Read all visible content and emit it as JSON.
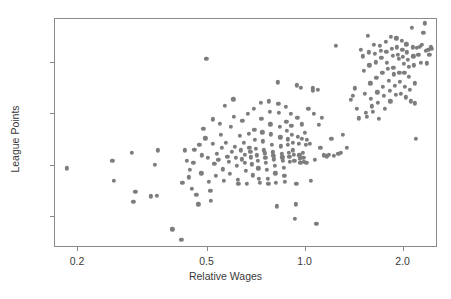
{
  "chart_data": {
    "type": "scatter",
    "title": "",
    "xlabel": "Relative Wages",
    "ylabel": "League Points",
    "xscale": "log",
    "yscale": "linear",
    "xlim": [
      0.17,
      2.55
    ],
    "ylim": [
      8,
      97
    ],
    "grid": false,
    "legend": null,
    "marker": {
      "shape": "circle",
      "color": "#7d7d7d",
      "size_px": 4.3
    },
    "xticks": [
      0.2,
      0.5,
      1.0,
      2.0
    ],
    "xtick_labels": [
      "0.2",
      "0.5",
      "1.0",
      "2.0"
    ],
    "yticks": [
      20,
      40,
      60,
      80
    ],
    "ytick_labels": [
      "20",
      "40",
      "60",
      "80"
    ],
    "n_points": 268,
    "points": [
      [
        0.185,
        39.0
      ],
      [
        0.255,
        41.9
      ],
      [
        0.258,
        34.2
      ],
      [
        0.292,
        45.0
      ],
      [
        0.3,
        29.7
      ],
      [
        0.296,
        26.0
      ],
      [
        0.335,
        28.1
      ],
      [
        0.35,
        28.2
      ],
      [
        0.345,
        40.2
      ],
      [
        0.352,
        46.0
      ],
      [
        0.39,
        15.3
      ],
      [
        0.415,
        11.2
      ],
      [
        0.425,
        45.9
      ],
      [
        0.418,
        33.3
      ],
      [
        0.432,
        42.0
      ],
      [
        0.44,
        38.3
      ],
      [
        0.438,
        35.5
      ],
      [
        0.455,
        46.2
      ],
      [
        0.452,
        41.0
      ],
      [
        0.448,
        30.9
      ],
      [
        0.462,
        28.6
      ],
      [
        0.468,
        25.0
      ],
      [
        0.472,
        48.0
      ],
      [
        0.48,
        44.0
      ],
      [
        0.478,
        37.0
      ],
      [
        0.485,
        54.2
      ],
      [
        0.492,
        50.6
      ],
      [
        0.496,
        81.4
      ],
      [
        0.5,
        43.0
      ],
      [
        0.505,
        33.7
      ],
      [
        0.51,
        30.3
      ],
      [
        0.512,
        26.4
      ],
      [
        0.518,
        58.0
      ],
      [
        0.52,
        48.5
      ],
      [
        0.525,
        40.8
      ],
      [
        0.53,
        36.0
      ],
      [
        0.535,
        44.5
      ],
      [
        0.54,
        42.2
      ],
      [
        0.545,
        56.3
      ],
      [
        0.55,
        52.0
      ],
      [
        0.552,
        46.8
      ],
      [
        0.558,
        38.6
      ],
      [
        0.562,
        34.0
      ],
      [
        0.566,
        63.2
      ],
      [
        0.57,
        49.0
      ],
      [
        0.575,
        43.5
      ],
      [
        0.58,
        41.4
      ],
      [
        0.584,
        36.8
      ],
      [
        0.59,
        55.0
      ],
      [
        0.595,
        45.5
      ],
      [
        0.6,
        65.8
      ],
      [
        0.602,
        59.0
      ],
      [
        0.605,
        47.2
      ],
      [
        0.61,
        43.0
      ],
      [
        0.615,
        40.0
      ],
      [
        0.618,
        34.4
      ],
      [
        0.622,
        32.8
      ],
      [
        0.628,
        51.6
      ],
      [
        0.632,
        46.0
      ],
      [
        0.636,
        42.5
      ],
      [
        0.64,
        57.5
      ],
      [
        0.645,
        48.8
      ],
      [
        0.65,
        44.2
      ],
      [
        0.652,
        41.0
      ],
      [
        0.656,
        38.0
      ],
      [
        0.66,
        33.0
      ],
      [
        0.665,
        60.0
      ],
      [
        0.668,
        52.5
      ],
      [
        0.672,
        47.0
      ],
      [
        0.676,
        45.4
      ],
      [
        0.68,
        43.2
      ],
      [
        0.684,
        40.5
      ],
      [
        0.688,
        36.2
      ],
      [
        0.692,
        62.0
      ],
      [
        0.696,
        54.0
      ],
      [
        0.7,
        50.0
      ],
      [
        0.704,
        46.5
      ],
      [
        0.708,
        44.0
      ],
      [
        0.712,
        42.0
      ],
      [
        0.716,
        39.0
      ],
      [
        0.72,
        34.8
      ],
      [
        0.724,
        33.2
      ],
      [
        0.728,
        64.5
      ],
      [
        0.732,
        58.2
      ],
      [
        0.736,
        53.0
      ],
      [
        0.74,
        49.5
      ],
      [
        0.744,
        46.0
      ],
      [
        0.748,
        44.8
      ],
      [
        0.752,
        43.0
      ],
      [
        0.756,
        41.2
      ],
      [
        0.76,
        38.5
      ],
      [
        0.764,
        35.0
      ],
      [
        0.768,
        32.9
      ],
      [
        0.772,
        65.0
      ],
      [
        0.776,
        61.0
      ],
      [
        0.78,
        56.0
      ],
      [
        0.784,
        52.2
      ],
      [
        0.788,
        48.0
      ],
      [
        0.792,
        45.2
      ],
      [
        0.796,
        43.8
      ],
      [
        0.8,
        42.5
      ],
      [
        0.804,
        40.0
      ],
      [
        0.808,
        37.0
      ],
      [
        0.812,
        33.4
      ],
      [
        0.816,
        24.2
      ],
      [
        0.82,
        72.4
      ],
      [
        0.824,
        64.0
      ],
      [
        0.828,
        60.5
      ],
      [
        0.832,
        55.0
      ],
      [
        0.836,
        51.0
      ],
      [
        0.84,
        47.5
      ],
      [
        0.844,
        44.6
      ],
      [
        0.848,
        43.2
      ],
      [
        0.852,
        41.8
      ],
      [
        0.856,
        39.2
      ],
      [
        0.86,
        36.0
      ],
      [
        0.864,
        33.6
      ],
      [
        0.868,
        62.8
      ],
      [
        0.872,
        57.0
      ],
      [
        0.876,
        53.5
      ],
      [
        0.88,
        50.2
      ],
      [
        0.884,
        48.0
      ],
      [
        0.888,
        45.0
      ],
      [
        0.892,
        43.5
      ],
      [
        0.896,
        41.5
      ],
      [
        0.9,
        60.0
      ],
      [
        0.904,
        55.5
      ],
      [
        0.908,
        52.0
      ],
      [
        0.912,
        49.0
      ],
      [
        0.916,
        46.0
      ],
      [
        0.92,
        44.2
      ],
      [
        0.924,
        42.0
      ],
      [
        0.928,
        19.2
      ],
      [
        0.932,
        25.0
      ],
      [
        0.936,
        33.0
      ],
      [
        0.94,
        71.2
      ],
      [
        0.944,
        58.5
      ],
      [
        0.948,
        51.2
      ],
      [
        0.952,
        48.5
      ],
      [
        0.956,
        44.0
      ],
      [
        0.96,
        42.6
      ],
      [
        0.964,
        41.0
      ],
      [
        0.968,
        70.3
      ],
      [
        0.972,
        56.0
      ],
      [
        0.976,
        50.5
      ],
      [
        0.98,
        45.0
      ],
      [
        0.984,
        43.0
      ],
      [
        0.988,
        41.4
      ],
      [
        0.995,
        52.8
      ],
      [
        1.0,
        48.2
      ],
      [
        1.005,
        41.0
      ],
      [
        1.01,
        50.0
      ],
      [
        1.02,
        62.0
      ],
      [
        1.03,
        48.5
      ],
      [
        1.04,
        34.2
      ],
      [
        1.05,
        70.0
      ],
      [
        1.055,
        69.2
      ],
      [
        1.06,
        60.2
      ],
      [
        1.07,
        42.2
      ],
      [
        1.08,
        17.5
      ],
      [
        1.09,
        69.5
      ],
      [
        1.1,
        55.8
      ],
      [
        1.11,
        47.0
      ],
      [
        1.12,
        58.5
      ],
      [
        1.14,
        44.0
      ],
      [
        1.16,
        43.6
      ],
      [
        1.18,
        44.2
      ],
      [
        1.2,
        50.5
      ],
      [
        1.22,
        43.8
      ],
      [
        1.24,
        86.5
      ],
      [
        1.26,
        44.5
      ],
      [
        1.28,
        45.0
      ],
      [
        1.3,
        52.0
      ],
      [
        1.34,
        47.0
      ],
      [
        1.38,
        65.5
      ],
      [
        1.4,
        67.2
      ],
      [
        1.42,
        70.0
      ],
      [
        1.44,
        62.0
      ],
      [
        1.46,
        58.4
      ],
      [
        1.48,
        85.0
      ],
      [
        1.5,
        82.5
      ],
      [
        1.51,
        76.8
      ],
      [
        1.52,
        68.0
      ],
      [
        1.53,
        60.5
      ],
      [
        1.54,
        59.0
      ],
      [
        1.55,
        90.5
      ],
      [
        1.56,
        84.0
      ],
      [
        1.57,
        79.0
      ],
      [
        1.58,
        72.0
      ],
      [
        1.59,
        66.0
      ],
      [
        1.6,
        63.0
      ],
      [
        1.61,
        61.0
      ],
      [
        1.62,
        87.0
      ],
      [
        1.63,
        83.5
      ],
      [
        1.64,
        80.2
      ],
      [
        1.65,
        74.0
      ],
      [
        1.66,
        68.5
      ],
      [
        1.67,
        64.5
      ],
      [
        1.68,
        58.2
      ],
      [
        1.69,
        86.5
      ],
      [
        1.7,
        84.5
      ],
      [
        1.71,
        82.0
      ],
      [
        1.72,
        76.0
      ],
      [
        1.73,
        70.5
      ],
      [
        1.74,
        67.0
      ],
      [
        1.75,
        62.0
      ],
      [
        1.76,
        88.0
      ],
      [
        1.77,
        84.2
      ],
      [
        1.78,
        80.0
      ],
      [
        1.79,
        77.5
      ],
      [
        1.8,
        73.0
      ],
      [
        1.81,
        69.0
      ],
      [
        1.82,
        65.0
      ],
      [
        1.83,
        90.2
      ],
      [
        1.84,
        85.5
      ],
      [
        1.85,
        82.8
      ],
      [
        1.86,
        78.0
      ],
      [
        1.87,
        75.5
      ],
      [
        1.88,
        71.0
      ],
      [
        1.89,
        67.5
      ],
      [
        1.9,
        89.5
      ],
      [
        1.91,
        86.0
      ],
      [
        1.92,
        83.0
      ],
      [
        1.93,
        81.5
      ],
      [
        1.94,
        76.2
      ],
      [
        1.95,
        72.5
      ],
      [
        1.96,
        68.0
      ],
      [
        1.97,
        88.5
      ],
      [
        1.98,
        85.0
      ],
      [
        1.99,
        82.2
      ],
      [
        2.0,
        79.5
      ],
      [
        2.01,
        76.0
      ],
      [
        2.02,
        70.5
      ],
      [
        2.03,
        66.5
      ],
      [
        2.04,
        87.2
      ],
      [
        2.05,
        84.0
      ],
      [
        2.06,
        81.0
      ],
      [
        2.07,
        78.5
      ],
      [
        2.08,
        74.5
      ],
      [
        2.09,
        69.5
      ],
      [
        2.1,
        65.0
      ],
      [
        2.12,
        93.5
      ],
      [
        2.13,
        86.0
      ],
      [
        2.14,
        82.5
      ],
      [
        2.15,
        79.0
      ],
      [
        2.16,
        72.0
      ],
      [
        2.17,
        64.2
      ],
      [
        2.18,
        50.5
      ],
      [
        2.2,
        85.8
      ],
      [
        2.22,
        83.0
      ],
      [
        2.24,
        86.2
      ],
      [
        2.26,
        80.0
      ],
      [
        2.28,
        87.0
      ],
      [
        2.3,
        91.5
      ],
      [
        2.32,
        95.3
      ],
      [
        2.34,
        84.5
      ],
      [
        2.36,
        79.8
      ],
      [
        2.38,
        85.0
      ],
      [
        2.4,
        83.2
      ],
      [
        2.42,
        86.0
      ],
      [
        2.44,
        85.5
      ]
    ]
  },
  "axes": {
    "x_axis_name": "Relative Wages",
    "y_axis_name": "League Points"
  }
}
